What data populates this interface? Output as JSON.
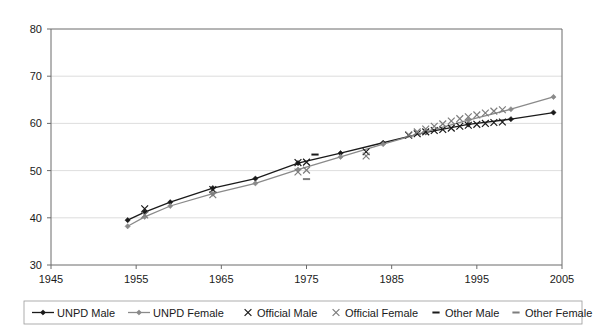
{
  "chart_data": {
    "type": "line",
    "title": "",
    "subtitle": "",
    "xlabel": "",
    "ylabel": "",
    "xlim": [
      1945,
      2005
    ],
    "ylim": [
      30,
      80
    ],
    "xticks": [
      1945,
      1955,
      1965,
      1975,
      1985,
      1995,
      2005
    ],
    "yticks": [
      30,
      40,
      50,
      60,
      70,
      80
    ],
    "xtick_labels": [
      "1945",
      "1955",
      "1965",
      "1975",
      "1985",
      "1995",
      "2005"
    ],
    "ytick_labels": [
      "30",
      "40",
      "50",
      "60",
      "70",
      "80"
    ],
    "grid": "horizontal",
    "legend_position": "bottom",
    "series": [
      {
        "name": "UNPD Male",
        "style": "line-marker",
        "marker": "diamond",
        "color": "#1a1a1a",
        "x": [
          1954,
          1956,
          1959,
          1964,
          1969,
          1974,
          1979,
          1984,
          1989,
          1994,
          1999,
          2004
        ],
        "values": [
          39.5,
          41.2,
          43.3,
          46.3,
          48.3,
          51.6,
          53.7,
          55.9,
          58.1,
          59.8,
          60.9,
          62.3
        ]
      },
      {
        "name": "UNPD Female",
        "style": "line-marker",
        "marker": "diamond",
        "color": "#8a8a8a",
        "x": [
          1954,
          1956,
          1959,
          1964,
          1969,
          1974,
          1979,
          1984,
          1989,
          1994,
          1999,
          2004
        ],
        "values": [
          38.2,
          40.2,
          42.5,
          45.1,
          47.3,
          50.2,
          52.9,
          55.6,
          58.2,
          60.7,
          63.0,
          65.6
        ]
      },
      {
        "name": "Official Male",
        "style": "marker-only",
        "marker": "x",
        "color": "#1a1a1a",
        "x": [
          1956,
          1964,
          1974,
          1975,
          1982,
          1987,
          1988,
          1989,
          1990,
          1991,
          1992,
          1993,
          1994,
          1995,
          1996,
          1997,
          1998
        ],
        "values": [
          41.9,
          46.0,
          51.7,
          51.8,
          54.0,
          57.5,
          57.8,
          58.2,
          58.5,
          58.7,
          59.0,
          59.4,
          59.6,
          59.8,
          60.0,
          60.2,
          60.3
        ]
      },
      {
        "name": "Official Female",
        "style": "marker-only",
        "marker": "x",
        "color": "#7d7d7d",
        "x": [
          1956,
          1964,
          1974,
          1975,
          1982,
          1987,
          1988,
          1989,
          1990,
          1991,
          1992,
          1993,
          1994,
          1995,
          1996,
          1997,
          1998
        ],
        "values": [
          40.6,
          44.9,
          49.7,
          50.1,
          53.1,
          57.6,
          58.2,
          58.8,
          59.4,
          59.9,
          60.5,
          61.0,
          61.4,
          61.8,
          62.2,
          62.6,
          62.9
        ]
      },
      {
        "name": "Other Male",
        "style": "marker-only",
        "marker": "dash",
        "color": "#1a1a1a",
        "x": [
          1976
        ],
        "values": [
          53.4
        ]
      },
      {
        "name": "Other Female",
        "style": "marker-only",
        "marker": "dash",
        "color": "#7d7d7d",
        "x": [
          1975
        ],
        "values": [
          48.2
        ]
      }
    ],
    "legend": [
      {
        "label": "UNPD Male",
        "marker": "line-diamond",
        "color": "#1a1a1a"
      },
      {
        "label": "UNPD Female",
        "marker": "line-diamond",
        "color": "#8a8a8a"
      },
      {
        "label": "Official Male",
        "marker": "x",
        "color": "#1a1a1a"
      },
      {
        "label": "Official Female",
        "marker": "x",
        "color": "#7d7d7d"
      },
      {
        "label": "Other Male",
        "marker": "dash",
        "color": "#1a1a1a"
      },
      {
        "label": "Other Female",
        "marker": "dash",
        "color": "#7d7d7d"
      }
    ]
  }
}
